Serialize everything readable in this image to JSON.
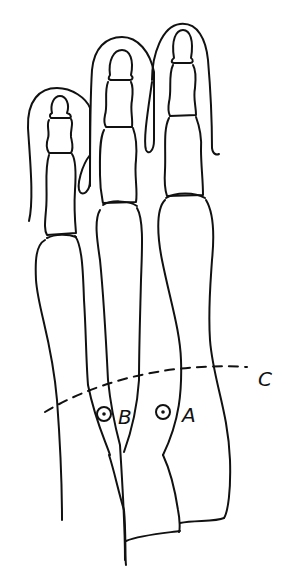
{
  "figure": {
    "type": "anatomical line drawing",
    "line_color": "#111111",
    "background": "#ffffff"
  },
  "labels": {
    "A": "A",
    "B": "B",
    "C": "C"
  },
  "markers": [
    {
      "id": "A",
      "description": "circled point between middle and right metatarsals"
    },
    {
      "id": "B",
      "description": "circled point between left and middle metatarsals"
    }
  ],
  "reference_line": {
    "id": "C",
    "style": "dashed arc across metatarsals"
  }
}
